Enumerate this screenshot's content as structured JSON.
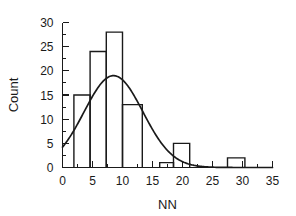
{
  "chart_data": {
    "type": "bar",
    "title": "",
    "subtitle": "",
    "xlabel": "NN",
    "ylabel": "Count",
    "xlim": [
      0,
      35
    ],
    "ylim": [
      0,
      30
    ],
    "grid": false,
    "legend": null,
    "x_ticks": [
      0,
      5,
      10,
      15,
      20,
      25,
      30,
      35
    ],
    "x_tick_labels": [
      "0",
      "5",
      "10",
      "15",
      "20",
      "25",
      "30",
      "35"
    ],
    "x_minor_tick_step": 2.5,
    "y_ticks": [
      0,
      5,
      10,
      15,
      20,
      25,
      30
    ],
    "y_tick_labels": [
      "0",
      "5",
      "10",
      "15",
      "20",
      "25",
      "30"
    ],
    "y_minor_tick_step": 2.5,
    "bin_width": 2.7,
    "bins": [
      {
        "x0": 1.9,
        "x1": 4.6,
        "count": 15
      },
      {
        "x0": 4.6,
        "x1": 7.3,
        "count": 24
      },
      {
        "x0": 7.3,
        "x1": 10.0,
        "count": 28
      },
      {
        "x0": 10.0,
        "x1": 13.3,
        "count": 13
      },
      {
        "x0": 16.2,
        "x1": 18.5,
        "count": 1
      },
      {
        "x0": 18.5,
        "x1": 21.2,
        "count": 5
      },
      {
        "x0": 27.5,
        "x1": 30.4,
        "count": 2
      }
    ],
    "categories": [
      "1.9-4.6",
      "4.6-7.3",
      "7.3-10.0",
      "10.0-13.3",
      "16.2-18.5",
      "18.5-21.2",
      "27.5-30.4"
    ],
    "values": [
      15,
      24,
      28,
      13,
      1,
      5,
      2
    ],
    "overlay_curve": {
      "name": "gaussian-fit",
      "type": "line",
      "peak_x": 8.5,
      "peak_y": 19.0,
      "sigma": 4.9,
      "x_start": 0.0,
      "y_start": 4.8,
      "x_end": 35.0
    },
    "colors": {
      "axis": "#1a1a1a",
      "bar_stroke": "#1a1a1a",
      "bar_fill": "#ffffff",
      "curve": "#1a1a1a",
      "background": "#ffffff"
    }
  }
}
